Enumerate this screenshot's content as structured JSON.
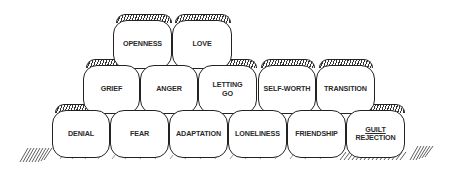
{
  "diagram": {
    "type": "pyramid-of-blocks",
    "rows": [
      {
        "level": "top",
        "blocks": [
          {
            "label": "OPENNESS"
          },
          {
            "label": "LOVE"
          }
        ]
      },
      {
        "level": "middle",
        "blocks": [
          {
            "label": "GRIEF"
          },
          {
            "label": "ANGER"
          },
          {
            "label": "LETTING GO",
            "line1": "LETTING",
            "line2": "GO"
          },
          {
            "label": "SELF-WORTH"
          },
          {
            "label": "TRANSITION"
          }
        ]
      },
      {
        "level": "bottom",
        "blocks": [
          {
            "label": "DENIAL"
          },
          {
            "label": "FEAR"
          },
          {
            "label": "ADAPTATION"
          },
          {
            "label": "LONELINESS"
          },
          {
            "label": "FRIENDSHIP"
          },
          {
            "label": "GUILT / REJECTION",
            "line1": "GUILT",
            "line2": "REJECTION"
          }
        ]
      }
    ],
    "colors": {
      "ink": "#222222",
      "background": "#ffffff"
    }
  }
}
